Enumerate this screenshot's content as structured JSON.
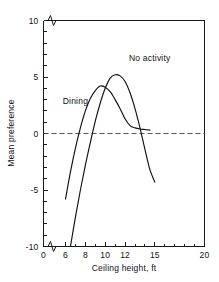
{
  "chart_data": {
    "type": "line",
    "title": "",
    "xlabel": "Ceiling height, ft",
    "ylabel": "Mean preference",
    "xlim": [
      0,
      20
    ],
    "ylim": [
      -10,
      10
    ],
    "grid": false,
    "legend_position": "inline-annotation",
    "axis_breaks": {
      "x": "break between 0 and 6",
      "y": "break marks at top and bottom of axis near 10 and -10"
    },
    "x_ticks": [
      {
        "value": 0,
        "label": "0"
      },
      {
        "value": 6,
        "label": "6"
      },
      {
        "value": 8,
        "label": "8"
      },
      {
        "value": 10,
        "label": "10"
      },
      {
        "value": 12,
        "label": "12"
      },
      {
        "value": 15,
        "label": "15"
      },
      {
        "value": 20,
        "label": "20"
      }
    ],
    "x_minor_ticks": [
      7,
      9,
      11,
      13,
      14,
      16,
      17,
      18,
      19
    ],
    "y_ticks": [
      {
        "value": 10,
        "label": "10"
      },
      {
        "value": 5,
        "label": "5"
      },
      {
        "value": 0,
        "label": "0"
      },
      {
        "value": -5,
        "label": "-5"
      },
      {
        "value": -10,
        "label": "-10"
      }
    ],
    "y_minor_ticks": [
      9,
      8,
      7,
      6,
      4,
      3,
      2,
      1,
      -1,
      -2,
      -3,
      -4,
      -6,
      -7,
      -8,
      -9
    ],
    "reference_lines": [
      {
        "axis": "y",
        "value": 0,
        "style": "dashed"
      }
    ],
    "series": [
      {
        "name": "Dining",
        "label": "Dining",
        "label_x": 7.0,
        "label_y": 2.6,
        "peak": {
          "x": 9.5,
          "y": 4.2
        },
        "points": [
          {
            "x": 6.0,
            "y": -5.8
          },
          {
            "x": 6.5,
            "y": -3.4
          },
          {
            "x": 7.0,
            "y": -1.3
          },
          {
            "x": 7.5,
            "y": 0.5
          },
          {
            "x": 8.0,
            "y": 2.0
          },
          {
            "x": 8.5,
            "y": 3.1
          },
          {
            "x": 9.0,
            "y": 3.8
          },
          {
            "x": 9.5,
            "y": 4.2
          },
          {
            "x": 10.0,
            "y": 4.1
          },
          {
            "x": 10.5,
            "y": 3.7
          },
          {
            "x": 11.0,
            "y": 3.0
          },
          {
            "x": 11.5,
            "y": 2.2
          },
          {
            "x": 12.0,
            "y": 1.3
          },
          {
            "x": 12.5,
            "y": 0.7
          },
          {
            "x": 13.0,
            "y": 0.5
          },
          {
            "x": 13.5,
            "y": 0.4
          },
          {
            "x": 14.0,
            "y": 0.35
          },
          {
            "x": 14.5,
            "y": 0.3
          }
        ]
      },
      {
        "name": "No activity",
        "label": "No activity",
        "label_x": 12.4,
        "label_y": 6.4,
        "peak": {
          "x": 11.0,
          "y": 5.2
        },
        "points": [
          {
            "x": 6.5,
            "y": -10.0
          },
          {
            "x": 7.0,
            "y": -7.4
          },
          {
            "x": 7.5,
            "y": -5.0
          },
          {
            "x": 8.0,
            "y": -2.8
          },
          {
            "x": 8.5,
            "y": -0.8
          },
          {
            "x": 9.0,
            "y": 1.1
          },
          {
            "x": 9.5,
            "y": 2.7
          },
          {
            "x": 10.0,
            "y": 4.0
          },
          {
            "x": 10.5,
            "y": 4.9
          },
          {
            "x": 11.0,
            "y": 5.2
          },
          {
            "x": 11.5,
            "y": 5.1
          },
          {
            "x": 12.0,
            "y": 4.6
          },
          {
            "x": 12.5,
            "y": 3.6
          },
          {
            "x": 13.0,
            "y": 2.2
          },
          {
            "x": 13.5,
            "y": 0.5
          },
          {
            "x": 14.0,
            "y": -1.4
          },
          {
            "x": 14.5,
            "y": -3.2
          },
          {
            "x": 15.0,
            "y": -4.3
          }
        ]
      }
    ]
  }
}
